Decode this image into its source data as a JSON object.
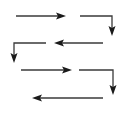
{
  "diagram": {
    "line_color": "#3a3a3a",
    "head_color": "#1a1a1a",
    "arrows": [
      {
        "id": "arrow-1",
        "kind": "straight",
        "direction": "right"
      },
      {
        "id": "arrow-2",
        "kind": "elbow",
        "direction": "right-then-down"
      },
      {
        "id": "arrow-3",
        "kind": "straight",
        "direction": "left"
      },
      {
        "id": "arrow-4",
        "kind": "elbow",
        "direction": "left-then-down"
      },
      {
        "id": "arrow-5",
        "kind": "straight",
        "direction": "right"
      },
      {
        "id": "arrow-6",
        "kind": "elbow",
        "direction": "right-then-down"
      },
      {
        "id": "arrow-7",
        "kind": "straight",
        "direction": "left"
      }
    ]
  }
}
